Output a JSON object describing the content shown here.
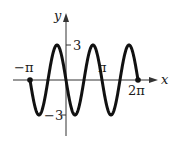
{
  "chart_data": {
    "type": "line",
    "title": "",
    "function": "y = -3 sin(2x)",
    "xlabel": "x",
    "ylabel": "y",
    "xlim": [
      -3.14159,
      6.28319
    ],
    "ylim": [
      -3,
      3
    ],
    "grid": false,
    "legend": null,
    "x_tick_labels": [
      "-π",
      "π",
      "2π"
    ],
    "y_tick_labels": [
      "3",
      "-3"
    ],
    "endpoints": [
      {
        "x": "-π",
        "y": 0
      },
      {
        "x": "2π",
        "y": 0
      }
    ],
    "series": [
      {
        "name": "curve",
        "x": [
          -3.14159,
          -2.35619,
          -1.5708,
          -0.7854,
          0,
          0.7854,
          1.5708,
          2.35619,
          3.14159,
          3.92699,
          4.71239,
          5.49779,
          6.28319
        ],
        "values": [
          0,
          -3,
          0,
          3,
          0,
          -3,
          0,
          3,
          0,
          -3,
          0,
          3,
          0
        ]
      }
    ]
  },
  "labels": {
    "x_axis": "x",
    "y_axis": "y",
    "neg_pi": "−π",
    "pi": "π",
    "two_pi": "2π",
    "pos3": "3",
    "neg3": "−3"
  }
}
